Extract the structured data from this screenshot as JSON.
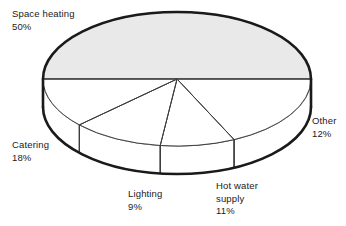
{
  "chart_data": {
    "type": "pie",
    "title": "",
    "subtitle": "",
    "xlabel": "",
    "ylabel": "",
    "style": "3d-exploded-cylinder",
    "legend_position": "outside-labels",
    "grid": false,
    "unit": "%",
    "categories": [
      "Space heating",
      "Catering",
      "Lighting",
      "Hot water supply",
      "Other"
    ],
    "values": [
      50,
      18,
      9,
      11,
      12
    ],
    "slices": [
      {
        "name": "Space heating",
        "label_lines": [
          "Space heating",
          "50%"
        ],
        "value": 50,
        "value_text": "50%",
        "fill": "#e9e9e9",
        "label_x": 12,
        "label_y": 17,
        "anchor": "start"
      },
      {
        "name": "Catering",
        "label_lines": [
          "Catering",
          "18%"
        ],
        "value": 18,
        "value_text": "18%",
        "fill": "#ffffff",
        "label_x": 12,
        "label_y": 148,
        "anchor": "start"
      },
      {
        "name": "Lighting",
        "label_lines": [
          "Lighting",
          "9%"
        ],
        "value": 9,
        "value_text": "9%",
        "fill": "#ffffff",
        "label_x": 128,
        "label_y": 197,
        "anchor": "start"
      },
      {
        "name": "Hot water supply",
        "label_lines": [
          "Hot water",
          "supply",
          "11%"
        ],
        "value": 11,
        "value_text": "11%",
        "fill": "#ffffff",
        "label_x": 216,
        "label_y": 189,
        "anchor": "start"
      },
      {
        "name": "Other",
        "label_lines": [
          "Other",
          "12%"
        ],
        "value": 12,
        "value_text": "12%",
        "fill": "#ffffff",
        "label_x": 312,
        "label_y": 124,
        "anchor": "start"
      }
    ],
    "geometry": {
      "center_x": 177,
      "center_y": 79,
      "radius_x": 134,
      "radius_y": 67,
      "depth": 28,
      "start_angle_deg": 180
    },
    "colors": {
      "outline": "#1a1a1a",
      "divider": "#3a3a3a",
      "shaded_slice": "#e9e9e9",
      "plain_slice": "#ffffff",
      "background": "#ffffff",
      "text": "#1a1a1a"
    }
  }
}
